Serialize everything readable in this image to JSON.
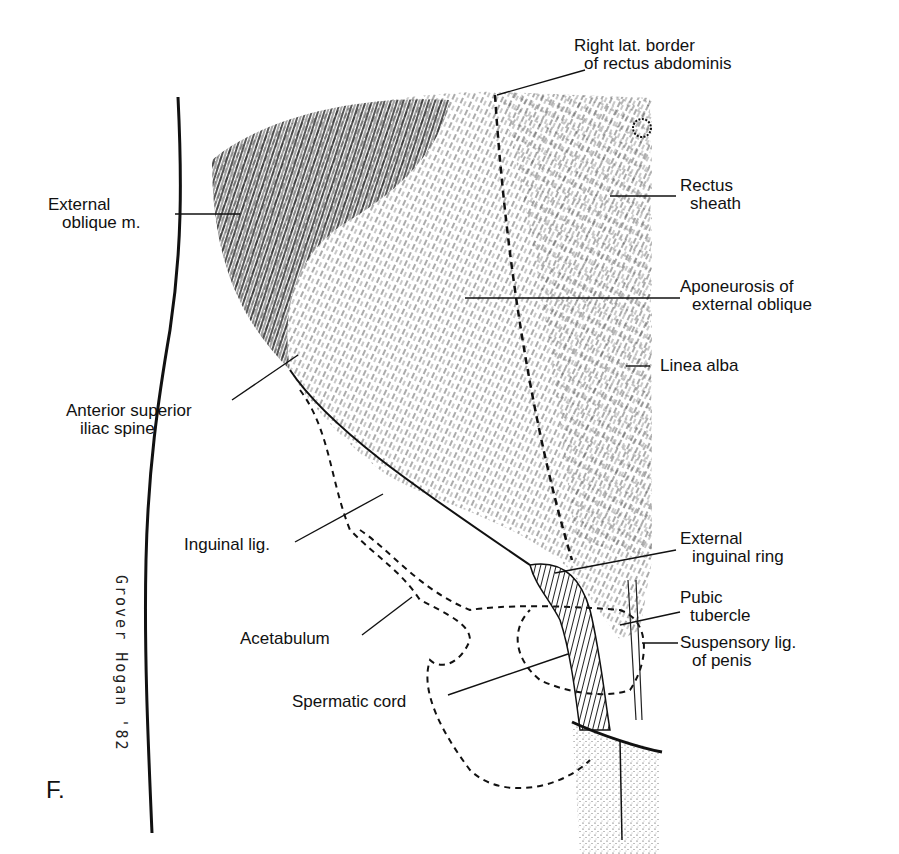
{
  "figure": {
    "panel_letter": "F.",
    "signature": "Grover Hogan '82",
    "colors": {
      "ink": "#111111",
      "background": "#ffffff"
    }
  },
  "labels": [
    {
      "id": "right-lat-border",
      "lines": [
        "Right lat. border",
        "of rectus abdominis"
      ]
    },
    {
      "id": "external-oblique",
      "lines": [
        "External",
        "oblique m."
      ]
    },
    {
      "id": "rectus-sheath",
      "lines": [
        "Rectus",
        "sheath"
      ]
    },
    {
      "id": "aponeurosis",
      "lines": [
        "Aponeurosis of",
        "external oblique"
      ]
    },
    {
      "id": "linea-alba",
      "lines": [
        "Linea alba"
      ]
    },
    {
      "id": "asis",
      "lines": [
        "Anterior superior",
        "iliac spine"
      ]
    },
    {
      "id": "inguinal-lig",
      "lines": [
        "Inguinal lig."
      ]
    },
    {
      "id": "external-inguinal-ring",
      "lines": [
        "External",
        "inguinal ring"
      ]
    },
    {
      "id": "pubic-tubercle",
      "lines": [
        "Pubic",
        "tubercle"
      ]
    },
    {
      "id": "acetabulum",
      "lines": [
        "Acetabulum"
      ]
    },
    {
      "id": "suspensory-lig",
      "lines": [
        "Suspensory lig.",
        "of penis"
      ]
    },
    {
      "id": "spermatic-cord",
      "lines": [
        "Spermatic cord"
      ]
    }
  ]
}
